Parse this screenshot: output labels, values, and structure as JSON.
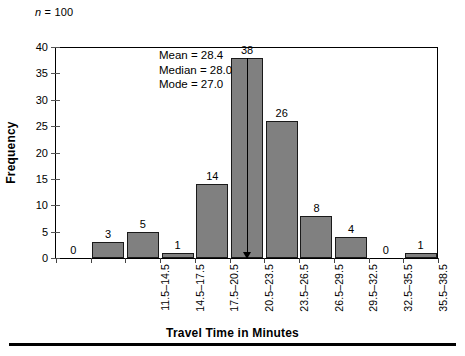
{
  "chart_data": {
    "type": "bar",
    "title": "",
    "xlabel": "Travel Time in Minutes",
    "ylabel": "Frequency",
    "categories": [
      "11.5–14.5",
      "14.5–17.5",
      "17.5–20.5",
      "20.5–23.5",
      "23.5–26.5",
      "26.5–29.5",
      "29.5–32.5",
      "32.5–35.5",
      "35.5–38.5",
      "38.5–41.5",
      "41.5–44.5"
    ],
    "values": [
      0,
      3,
      5,
      1,
      14,
      38,
      26,
      8,
      4,
      0,
      1
    ],
    "ylim": [
      0,
      40
    ],
    "ytick_values": [
      0,
      5,
      10,
      15,
      20,
      25,
      30,
      35,
      40
    ],
    "ytick_labels": [
      "0",
      "5",
      "10",
      "15",
      "20",
      "25",
      "30",
      "35",
      "40"
    ],
    "grid": false,
    "legend": false,
    "bar_color": "#808080",
    "bar_edge_color": "#1a1a1a",
    "first_empty_label": "0",
    "annotations": {
      "sample_size_symbol": "n",
      "sample_size_text": " = 100",
      "pointer_bin_index": 5,
      "pointer_icon": "down-arrow"
    },
    "stats": [
      "Mean = 28.4",
      "Median = 28.0",
      "Mode = 27.0"
    ]
  }
}
